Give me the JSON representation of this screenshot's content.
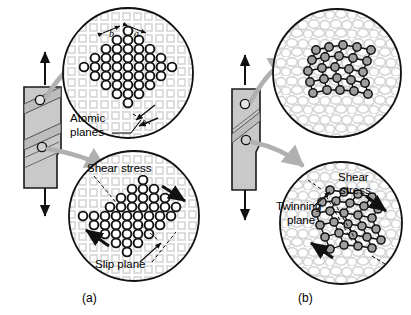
{
  "figure": {
    "background": "#ffffff",
    "width": 411,
    "height": 315,
    "panels": [
      {
        "id": "a",
        "caption": "(a)",
        "mechanism": "slip",
        "specimen": {
          "name": "tensile-specimen-slip",
          "fill": "#c9c9c9",
          "stroke": "#1a1a1a",
          "load_arrows": [
            "up",
            "down"
          ],
          "band_label": "slip band",
          "callout_markers": 2
        },
        "top_circle": {
          "name": "undeformed-lattice",
          "lattice_type": "cubic",
          "atom_fill": "#ffffff",
          "atom_stroke": "#111111",
          "background_texture": "square-grid",
          "labels": [
            {
              "text": "b",
              "style": "italic",
              "kind": "dimension"
            },
            {
              "text": "a",
              "style": "italic",
              "kind": "dimension"
            },
            {
              "text": "Atomic",
              "kind": "callout"
            },
            {
              "text": "planes",
              "kind": "callout"
            }
          ]
        },
        "bottom_circle": {
          "name": "slipped-lattice",
          "lattice_type": "cubic-sheared",
          "labels": [
            {
              "text": "Shear stress",
              "kind": "callout"
            },
            {
              "text": "Slip plane",
              "kind": "callout"
            }
          ],
          "shear_arrows": 2
        }
      },
      {
        "id": "b",
        "caption": "(b)",
        "mechanism": "twinning",
        "specimen": {
          "name": "tensile-specimen-twin",
          "fill": "#c9c9c9",
          "stroke": "#1a1a1a",
          "load_arrows": [
            "up",
            "down"
          ],
          "band_label": "twin band",
          "callout_markers": 2
        },
        "top_circle": {
          "name": "undeformed-lattice-hex",
          "lattice_type": "hexagonal",
          "atom_fill": "#9e9e9e",
          "atom_stroke": "#111111",
          "background_texture": "bubble-grain",
          "labels": []
        },
        "bottom_circle": {
          "name": "twinned-lattice",
          "lattice_type": "hexagonal-mirrored",
          "labels": [
            {
              "text": "Shear",
              "kind": "callout"
            },
            {
              "text": "stress",
              "kind": "callout"
            },
            {
              "text": "Twinning",
              "kind": "callout"
            },
            {
              "text": "plane",
              "kind": "callout"
            }
          ],
          "shear_arrows": 2
        }
      }
    ],
    "colors": {
      "ink": "#111111",
      "specimen_fill": "#c9c9c9",
      "callout_arrow": "#b0b0b0",
      "texture_light": "#d8d8d8",
      "atom_white": "#ffffff",
      "atom_gray": "#9e9e9e",
      "circle_outline": "#111111"
    }
  }
}
